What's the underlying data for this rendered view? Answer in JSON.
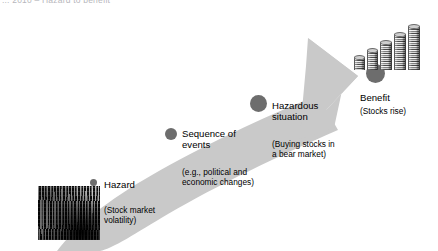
{
  "header": {
    "caption": "... 2010 – Hazard to benefit"
  },
  "diagram": {
    "type": "process-flow-arrow",
    "arrow": {
      "name": "upward-curved-arrow",
      "direction": "bottom-left-to-top-right",
      "fill_color": "#c9c9c9"
    },
    "node_color": "#6d6d6d",
    "nodes": [
      {
        "id": "hazard",
        "label": "Hazard",
        "sublabel": "(Stock market\nvolatility)",
        "dot_size_px": 7
      },
      {
        "id": "sequence-of-events",
        "label": "Sequence of\nevents",
        "sublabel": "(e.g., political and\neconomic changes)",
        "dot_size_px": 12
      },
      {
        "id": "hazardous-situation",
        "label": "Hazardous\nsituation",
        "sublabel": "(Buying stocks in\na bear market)",
        "dot_size_px": 17
      },
      {
        "id": "benefit",
        "label": "Benefit",
        "sublabel": "(Stocks rise)",
        "dot_size_px": 19
      }
    ],
    "images": [
      {
        "id": "stock-volatility-photo",
        "alt": "stock-market-board-photo",
        "position": "bottom-left"
      },
      {
        "id": "coin-stacks-photo",
        "alt": "rising-coin-stacks-photo",
        "position": "top-right",
        "stack_count": 5
      }
    ]
  }
}
